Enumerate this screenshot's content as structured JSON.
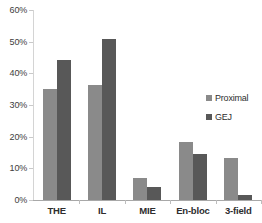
{
  "chart_data": {
    "type": "bar",
    "title": "",
    "subtitle": "",
    "xlabel": "",
    "ylabel": "",
    "categories": [
      "THE",
      "IL",
      "MIE",
      "En-bloc",
      "3-field"
    ],
    "series": [
      {
        "name": "Proximal",
        "color": "#8a8a8a",
        "values": [
          35.2,
          36.4,
          6.8,
          18.4,
          13.4
        ]
      },
      {
        "name": "GEJ",
        "color": "#585858",
        "values": [
          44.2,
          50.7,
          4.2,
          14.6,
          1.7
        ]
      }
    ],
    "ylim": [
      0,
      60
    ],
    "yticks": [
      0,
      10,
      20,
      30,
      40,
      50,
      60
    ],
    "ytick_labels": [
      "0%",
      "10%",
      "20%",
      "30%",
      "40%",
      "50%",
      "60%"
    ],
    "grid": false,
    "legend_position": "right-middle"
  },
  "legend": {
    "entries": [
      {
        "label": "Proximal",
        "swatch": "legend-swatch-proximal"
      },
      {
        "label": "GEJ",
        "swatch": "legend-swatch-gej"
      }
    ]
  },
  "axis": {
    "y_ticks": [
      "0%",
      "10%",
      "20%",
      "30%",
      "40%",
      "50%",
      "60%"
    ],
    "x_categories": [
      "THE",
      "IL",
      "MIE",
      "En-bloc",
      "3-field"
    ]
  },
  "colors": {
    "proximal": "#8a8a8a",
    "gej": "#585858",
    "axis": "#a8a8a8",
    "text": "#2e2e2e",
    "background": "#ffffff"
  }
}
